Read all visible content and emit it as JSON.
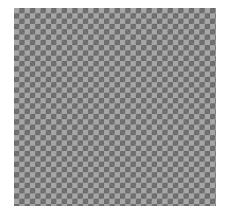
{
  "checkerboard": {
    "columns": 38,
    "rows": 37,
    "cell_size_px": 5.3,
    "colors": {
      "dark": "#6b6b6b",
      "light": "#a6a6a6",
      "background": "#ffffff"
    }
  }
}
